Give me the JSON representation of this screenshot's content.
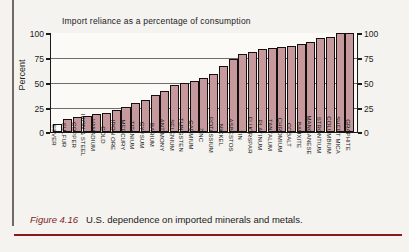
{
  "figure": {
    "number_label": "Figure 4.16",
    "caption": "U.S. dependence on imported minerals and metals."
  },
  "colors": {
    "bar_fill": "#c69a9c",
    "bar_outline": "#15100f",
    "caption_accent": "#7e1f1f",
    "rule": "#8b1b1b",
    "plot_bg": "#fbfaf7",
    "page_bg": "#f5f3ef"
  },
  "chart_data": {
    "type": "bar",
    "title": "Import reliance as a percentage of consumption",
    "xlabel": "",
    "ylabel": "Percent",
    "ylim": [
      0,
      100
    ],
    "yticks": [
      0,
      25,
      50,
      75,
      100
    ],
    "ytick_labels": [
      "0",
      "25",
      "50",
      "75",
      "100"
    ],
    "right_axis_ticks": [
      0,
      25,
      50,
      75,
      100
    ],
    "right_axis_tick_labels": [
      "0",
      "25",
      "50",
      "75",
      "100"
    ],
    "grid": true,
    "legend": null,
    "categories": [
      "SILVER",
      "SULFUR",
      "COPPER",
      "IRON & STEEL",
      "VANADIUM",
      "GOLD",
      "IRON ORE",
      "MERCURY",
      "TITANIUM",
      "GYPSUM",
      "BARIUM",
      "ANTIMONY",
      "SELENIUM",
      "TUNGSTEN",
      "CADMIUM",
      "ZINC",
      "POTASSIUM",
      "NICKEL",
      "ASBESTOS",
      "TIN",
      "FLUORSPAR",
      "PLATINUM",
      "TANTALUM",
      "CHROMIUM",
      "COBALT",
      "BAUXITE",
      "MANGANESE",
      "STRONTIUM",
      "COLUMBIUM",
      "SHEET MICA",
      "GRAPHITE"
    ],
    "values": [
      8,
      13,
      15,
      16,
      18,
      19,
      22,
      25,
      29,
      32,
      37,
      41,
      47,
      50,
      52,
      55,
      59,
      67,
      74,
      79,
      81,
      84,
      85,
      86,
      87,
      89,
      91,
      95,
      96,
      100,
      100
    ],
    "value_unit": "%",
    "first_bar_unfilled": true
  }
}
